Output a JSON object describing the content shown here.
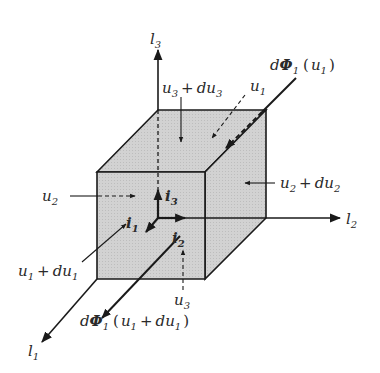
{
  "diagram": {
    "colors": {
      "face_fill": "#cfcfcf",
      "face_top": "#d4d4d4",
      "face_right": "#c8c8c8",
      "stroke": "#1a1a1a"
    },
    "axes": {
      "l1": {
        "base": "l",
        "sub": "1"
      },
      "l2": {
        "base": "l",
        "sub": "2"
      },
      "l3": {
        "base": "l",
        "sub": "3"
      }
    },
    "unit_vectors": {
      "i1": {
        "base": "i",
        "sub": "1"
      },
      "i2": {
        "base": "i",
        "sub": "2"
      },
      "i3": {
        "base": "i",
        "sub": "3"
      }
    },
    "labels": {
      "u1": {
        "base": "u",
        "sub": "1"
      },
      "u2": {
        "base": "u",
        "sub": "2"
      },
      "u3": {
        "base": "u",
        "sub": "3"
      },
      "u1_du1": {
        "a": "u",
        "a_sub": "1",
        "op": "+",
        "b": "du",
        "b_sub": "1"
      },
      "u2_du2": {
        "a": "u",
        "a_sub": "2",
        "op": "+",
        "b": "du",
        "b_sub": "2"
      },
      "u3_du3": {
        "a": "u",
        "a_sub": "3",
        "op": "+",
        "b": "du",
        "b_sub": "3"
      },
      "flux_in": {
        "d": "d",
        "phi": "Φ",
        "sub": "1",
        "open": "(",
        "arg": "u",
        "arg_sub": "1",
        "close": ")"
      },
      "flux_out": {
        "d": "d",
        "phi": "Φ",
        "sub": "1",
        "open": "(",
        "arg": "u",
        "arg_sub": "1",
        "plus": "+",
        "arg2": "du",
        "arg2_sub": "1",
        "close": ")"
      }
    }
  }
}
